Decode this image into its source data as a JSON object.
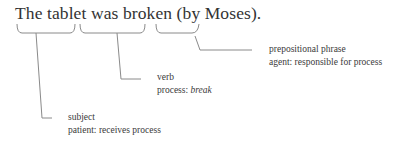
{
  "sentence": {
    "part1": "The tablet",
    "part2": "was broken",
    "part3": "(by Moses)."
  },
  "annotations": [
    {
      "title": "prepositional phrase",
      "role_prefix": "agent: ",
      "role_text": "responsible for process"
    },
    {
      "title": "verb",
      "role_prefix": "process: ",
      "role_text": "break"
    },
    {
      "title": "subject",
      "role_prefix": "patient: ",
      "role_text": "receives process"
    }
  ],
  "colors": {
    "text": "#333333",
    "lines": "#8a8a8a"
  }
}
